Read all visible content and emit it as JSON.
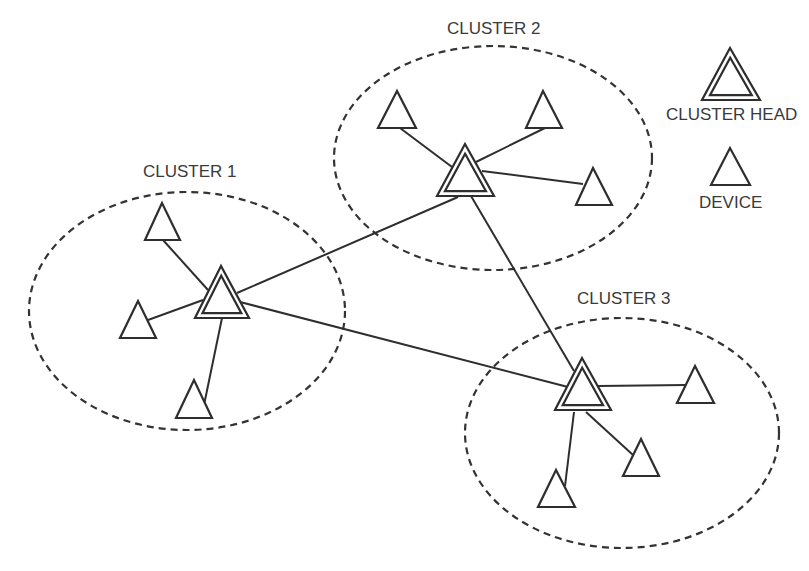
{
  "diagram": {
    "colors": {
      "stroke": "#2e2e2e",
      "dash": "#333333",
      "text": "#3a3a3a",
      "background": "#ffffff"
    },
    "clusters": [
      {
        "id": "cluster-1",
        "label": "CLUSTER 1",
        "label_pos": [
          143,
          164
        ],
        "ellipse": {
          "cx": 187,
          "cy": 311,
          "rx": 158,
          "ry": 119
        },
        "head": {
          "apex": [
            221,
            266
          ],
          "base_left": [
            195,
            318
          ],
          "base_right": [
            249,
            318
          ]
        },
        "devices": [
          {
            "apex": [
              162,
              203
            ],
            "base_left": [
              145,
              240
            ],
            "base_right": [
              180,
              240
            ],
            "link": [
              [
                163,
                240
              ],
              [
                208,
                290
              ]
            ]
          },
          {
            "apex": [
              138,
              301
            ],
            "base_left": [
              120,
              338
            ],
            "base_right": [
              156,
              338
            ],
            "link": [
              [
                148,
                320
              ],
              [
                203,
                300
              ]
            ]
          },
          {
            "apex": [
              194,
              380
            ],
            "base_left": [
              176,
              418
            ],
            "base_right": [
              212,
              418
            ],
            "link": [
              [
                204,
                405
              ],
              [
                222,
                318
              ]
            ]
          }
        ]
      },
      {
        "id": "cluster-2",
        "label": "CLUSTER 2",
        "label_pos": [
          447,
          21
        ],
        "ellipse": {
          "cx": 493,
          "cy": 158,
          "rx": 159,
          "ry": 112
        },
        "head": {
          "apex": [
            465,
            144
          ],
          "base_left": [
            437,
            196
          ],
          "base_right": [
            494,
            196
          ]
        },
        "devices": [
          {
            "apex": [
              397,
              91
            ],
            "base_left": [
              378,
              128
            ],
            "base_right": [
              416,
              128
            ],
            "link": [
              [
                400,
                128
              ],
              [
                452,
                167
              ]
            ]
          },
          {
            "apex": [
              543,
              91
            ],
            "base_left": [
              526,
              128
            ],
            "base_right": [
              562,
              128
            ],
            "link": [
              [
                545,
                128
              ],
              [
                476,
                162
              ]
            ]
          },
          {
            "apex": [
              593,
              168
            ],
            "base_left": [
              576,
              205
            ],
            "base_right": [
              612,
              205
            ],
            "link": [
              [
                583,
                184
              ],
              [
                482,
                171
              ]
            ]
          }
        ]
      },
      {
        "id": "cluster-3",
        "label": "CLUSTER 3",
        "label_pos": [
          577,
          291
        ],
        "ellipse": {
          "cx": 622,
          "cy": 433,
          "rx": 157,
          "ry": 115
        },
        "head": {
          "apex": [
            582,
            358
          ],
          "base_left": [
            555,
            410
          ],
          "base_right": [
            611,
            410
          ]
        },
        "devices": [
          {
            "apex": [
              695,
              366
            ],
            "base_left": [
              677,
              403
            ],
            "base_right": [
              714,
              403
            ],
            "link": [
              [
                686,
                385
              ],
              [
                598,
                386
              ]
            ]
          },
          {
            "apex": [
              641,
              439
            ],
            "base_left": [
              623,
              476
            ],
            "base_right": [
              659,
              476
            ],
            "link": [
              [
                633,
                455
              ],
              [
                586,
                412
              ]
            ]
          },
          {
            "apex": [
              556,
              470
            ],
            "base_left": [
              538,
              507
            ],
            "base_right": [
              575,
              507
            ],
            "link": [
              [
                565,
                486
              ],
              [
                574,
                412
              ]
            ]
          }
        ]
      }
    ],
    "inter_links": [
      {
        "from": "cluster-1",
        "to": "cluster-2",
        "points": [
          [
            237,
            293
          ],
          [
            458,
            197
          ]
        ]
      },
      {
        "from": "cluster-1",
        "to": "cluster-3",
        "points": [
          [
            240,
            302
          ],
          [
            568,
            387
          ]
        ]
      },
      {
        "from": "cluster-2",
        "to": "cluster-3",
        "points": [
          [
            471,
            196
          ],
          [
            574,
            371
          ]
        ]
      }
    ],
    "legend": {
      "head": {
        "label": "CLUSTER HEAD",
        "label_pos": [
          666,
          107
        ],
        "apex": [
          730,
          48
        ],
        "base_left": [
          702,
          100
        ],
        "base_right": [
          760,
          100
        ]
      },
      "device": {
        "label": "DEVICE",
        "label_pos": [
          699,
          195
        ],
        "apex": [
          730,
          148
        ],
        "base_left": [
          711,
          185
        ],
        "base_right": [
          750,
          185
        ]
      }
    }
  }
}
